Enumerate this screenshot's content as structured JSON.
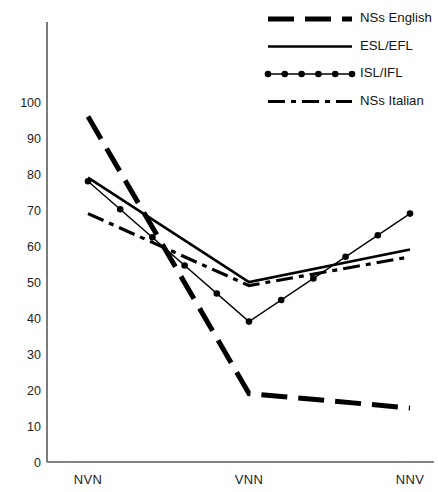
{
  "chart_data": {
    "type": "line",
    "title": "",
    "subtitle": "",
    "xlabel": "",
    "ylabel": "",
    "categories": [
      "NVN",
      "VNN",
      "NNV"
    ],
    "xlim": [
      0,
      2
    ],
    "ylim": [
      0,
      105
    ],
    "ytick_labels": [
      "0",
      "10",
      "20",
      "30",
      "40",
      "50",
      "60",
      "70",
      "80",
      "90",
      "100"
    ],
    "ytick_values": [
      0,
      10,
      20,
      30,
      40,
      50,
      60,
      70,
      80,
      90,
      100
    ],
    "grid": false,
    "legend_position": "top-right",
    "series": [
      {
        "name": "NSs English",
        "style": "dashed",
        "markers": false,
        "values": [
          96,
          19,
          15
        ]
      },
      {
        "name": "ESL/EFL",
        "style": "solid",
        "markers": false,
        "values": [
          79,
          50,
          59
        ]
      },
      {
        "name": "ISL/IFL",
        "style": "dotted-markers",
        "markers": true,
        "values": [
          78,
          39,
          69
        ]
      },
      {
        "name": "NSs Italian",
        "style": "dash-dot",
        "markers": false,
        "values": [
          69,
          49,
          57
        ]
      }
    ]
  },
  "legend": {
    "entries": [
      {
        "label": "NSs English"
      },
      {
        "label": "ESL/EFL"
      },
      {
        "label": "ISL/IFL"
      },
      {
        "label": "NSs Italian"
      }
    ]
  },
  "axes": {
    "x_categories": [
      "NVN",
      "VNN",
      "NNV"
    ],
    "y_labels": [
      "100",
      "90",
      "80",
      "70",
      "60",
      "50",
      "40",
      "30",
      "20",
      "10",
      "0"
    ]
  }
}
